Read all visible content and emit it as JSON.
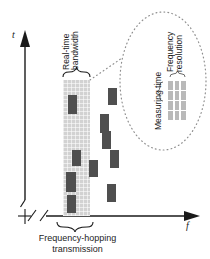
{
  "figure": {
    "type": "time-frequency-diagram",
    "caption_lines": [
      "Frequency-hopping",
      "transmission"
    ]
  },
  "axes": {
    "vertical": {
      "label": "t",
      "name": "time-axis"
    },
    "horizontal": {
      "label": "f",
      "name": "frequency-axis"
    },
    "break_marks": 2
  },
  "band": {
    "label_lines": [
      "Real-time",
      "bandwidth"
    ],
    "fill_color": "#d2d2d2",
    "x": 63,
    "y": 80,
    "width": 27,
    "height": 135
  },
  "bursts": {
    "color": "#4f4f4f",
    "inside_band": [
      {
        "x": 68,
        "y": 95,
        "w": 9,
        "h": 19
      },
      {
        "x": 72,
        "y": 150,
        "w": 9,
        "h": 16
      },
      {
        "x": 66,
        "y": 172,
        "w": 10,
        "h": 20
      },
      {
        "x": 67,
        "y": 195,
        "w": 9,
        "h": 18
      }
    ],
    "outside_band": [
      {
        "x": 108,
        "y": 88,
        "w": 9,
        "h": 17
      },
      {
        "x": 100,
        "y": 114,
        "w": 9,
        "h": 19
      },
      {
        "x": 102,
        "y": 131,
        "w": 9,
        "h": 18
      },
      {
        "x": 110,
        "y": 150,
        "w": 9,
        "h": 18
      },
      {
        "x": 89,
        "y": 160,
        "w": 9,
        "h": 17
      },
      {
        "x": 107,
        "y": 184,
        "w": 9,
        "h": 18
      }
    ]
  },
  "callout": {
    "shape": "ellipse",
    "border_style": "dotted",
    "leader_style": "dotted",
    "measuring_time_label": "Measuring time",
    "frequency_resolution_lines": [
      "Frequency",
      "resolution"
    ],
    "grid": {
      "columns": 3,
      "rows": 4,
      "cell_color": "#b9b9b9"
    }
  },
  "colors": {
    "band_fill": "#d2d2d2",
    "burst": "#4f4f4f",
    "grid_cell": "#b9b9b9",
    "stroke": "#1a1a1a",
    "dotted": "#9a9a9a"
  }
}
